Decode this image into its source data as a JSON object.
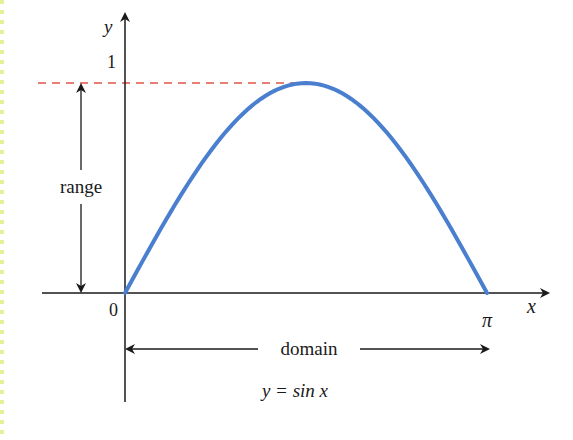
{
  "figure": {
    "y_axis_label": "y",
    "x_axis_label": "x",
    "y_tick": "1",
    "origin_label": "0",
    "x_end_label": "π",
    "range_label": "range",
    "domain_label": "domain",
    "caption": "y = sin x"
  },
  "colors": {
    "curve": "#4a7fd0",
    "dashed_line": "#e0554a",
    "axes": "#1a1a1a",
    "left_border": "#e8ef9a"
  },
  "chart_data": {
    "type": "line",
    "title": "y = sin x",
    "xlabel": "x",
    "ylabel": "y",
    "x_ticks": [
      "0",
      "π"
    ],
    "y_ticks": [
      "1"
    ],
    "xlim": [
      0,
      3.14159
    ],
    "ylim": [
      0,
      1
    ],
    "series": [
      {
        "name": "y = sin x",
        "x": [
          0,
          0.3927,
          0.7854,
          1.1781,
          1.5708,
          1.9635,
          2.3562,
          2.7489,
          3.14159
        ],
        "values": [
          0,
          0.3827,
          0.7071,
          0.9239,
          1,
          0.9239,
          0.7071,
          0.3827,
          0
        ]
      }
    ],
    "annotations": [
      {
        "text": "range",
        "type": "double-arrow",
        "span": "y from 0 to 1"
      },
      {
        "text": "domain",
        "type": "double-arrow",
        "span": "x from 0 to π"
      },
      {
        "text": "y = 1",
        "type": "dashed-horizontal-line"
      }
    ],
    "grid": false,
    "legend": "none"
  }
}
